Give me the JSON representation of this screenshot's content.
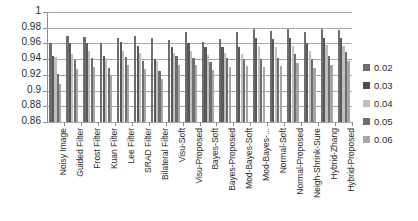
{
  "chart_data": {
    "type": "bar",
    "title": "",
    "subtitle": "",
    "xlabel": "",
    "ylabel": "",
    "ylim": [
      0.86,
      1
    ],
    "ytick_labels": [
      "1",
      "0.98",
      "0.96",
      "0.94",
      "0.92",
      "0.9",
      "0.88",
      "0.86"
    ],
    "ytick_values": [
      1,
      0.98,
      0.96,
      0.94,
      0.92,
      0.9,
      0.88,
      0.86
    ],
    "grid": true,
    "grid_axis": "y",
    "legend_position": "right",
    "legend_title": "",
    "orientation": "vertical",
    "grouping": "clustered",
    "categories": [
      "Noisy Image",
      "Guided Filter",
      "Frost Filter",
      "Kuan Filter",
      "Lee Filter",
      "SRAD Filter",
      "Bilateral Filter",
      "Visu-Soft",
      "Visu-Proposed",
      "Bayes-Soft",
      "Bayes-Proposed",
      "Mod-Bayes-Soft",
      "Mod-Bayes-...",
      "Normal-Soft",
      "Normal-Proposed",
      "Neigh-Shrink-Sure",
      "Hybrid-Zhang",
      "Hybrid-Proposed"
    ],
    "series": [
      {
        "name": "0.02",
        "color": "#6e6e6e",
        "values": [
          0.96,
          0.97,
          0.968,
          0.961,
          0.967,
          0.97,
          0.967,
          0.965,
          0.975,
          0.962,
          0.966,
          0.974,
          0.978,
          0.976,
          0.978,
          0.974,
          0.978,
          0.977
        ]
      },
      {
        "name": "0.03",
        "color": "#595959",
        "values": [
          0.944,
          0.96,
          0.961,
          0.944,
          0.962,
          0.957,
          0.94,
          0.955,
          0.961,
          0.956,
          0.955,
          0.956,
          0.967,
          0.966,
          0.967,
          0.96,
          0.967,
          0.967
        ]
      },
      {
        "name": "0.04",
        "color": "#bfbfbf",
        "values": [
          0.943,
          0.947,
          0.95,
          0.942,
          0.951,
          0.948,
          0.938,
          0.948,
          0.951,
          0.945,
          0.948,
          0.947,
          0.957,
          0.955,
          0.957,
          0.951,
          0.958,
          0.957
        ]
      },
      {
        "name": "0.05",
        "color": "#6e6e6e",
        "values": [
          0.921,
          0.939,
          0.941,
          0.929,
          0.943,
          0.938,
          0.925,
          0.944,
          0.941,
          0.937,
          0.941,
          0.94,
          0.94,
          0.941,
          0.946,
          0.94,
          0.944,
          0.949
        ]
      },
      {
        "name": "0.06",
        "color": "#a6a6a6",
        "values": [
          0.908,
          0.928,
          0.93,
          0.919,
          0.932,
          0.928,
          0.915,
          0.933,
          0.932,
          0.926,
          0.93,
          0.931,
          0.93,
          0.931,
          0.935,
          0.929,
          0.933,
          0.938
        ]
      }
    ]
  },
  "legend": {
    "items": [
      {
        "label": "0.02",
        "swatch": "#6e6e6e"
      },
      {
        "label": "0.03",
        "swatch": "#4d4d4d"
      },
      {
        "label": "0.04",
        "swatch": "#bfbfbf"
      },
      {
        "label": "0.05",
        "swatch": "#6e6e6e"
      },
      {
        "label": "0.06",
        "swatch": "#a6a6a6"
      }
    ]
  },
  "axis": {
    "y_min": 0.86,
    "y_max": 1,
    "y_step": 0.02
  }
}
